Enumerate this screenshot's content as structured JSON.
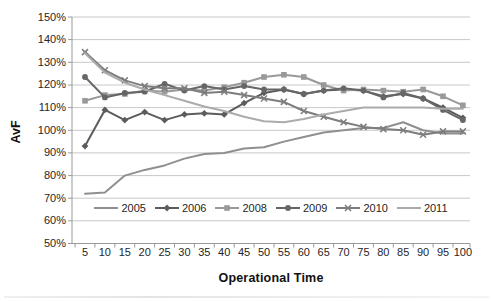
{
  "chart_data": {
    "type": "line",
    "title": "",
    "xlabel": "Operational Time",
    "ylabel": "AvF",
    "x": [
      5,
      10,
      15,
      20,
      25,
      30,
      35,
      40,
      45,
      50,
      55,
      60,
      65,
      70,
      75,
      80,
      85,
      90,
      95,
      100
    ],
    "ylim": [
      50,
      150
    ],
    "y_tick_step": 10,
    "y_tick_suffix": "%",
    "grid": "horizontal",
    "legend_position": "inside-bottom",
    "legend_entries": [
      "2005",
      "2006",
      "2008",
      "2009",
      "2010",
      "2011"
    ],
    "series": [
      {
        "name": "2005",
        "marker": "none",
        "color": "#8f8f8f",
        "values": [
          72,
          72.5,
          80,
          82.5,
          84.5,
          87.5,
          89.5,
          90,
          92,
          92.5,
          95,
          97,
          99,
          100,
          101,
          101,
          103.5,
          100,
          98.5,
          98.5
        ]
      },
      {
        "name": "2006",
        "marker": "diamond",
        "color": "#5c5c5c",
        "values": [
          93,
          109,
          104.5,
          108,
          104.5,
          107,
          107.5,
          107,
          112,
          116.5,
          118,
          116,
          117.5,
          118,
          117.5,
          115,
          116,
          114,
          110,
          105.5
        ]
      },
      {
        "name": "2008",
        "marker": "square",
        "color": "#999999",
        "values": [
          113,
          115.5,
          116,
          117.5,
          117,
          118,
          117.5,
          119,
          121,
          123.5,
          124.5,
          123.5,
          120,
          117.5,
          118,
          117.5,
          117,
          118,
          115,
          111
        ]
      },
      {
        "name": "2009",
        "marker": "circle",
        "color": "#666666",
        "values": [
          123.5,
          114.5,
          116.5,
          117,
          120.5,
          117.5,
          119.5,
          118,
          119.5,
          118,
          118,
          116,
          117.5,
          118.5,
          117.5,
          114.5,
          116.5,
          114,
          109,
          104.5
        ]
      },
      {
        "name": "2010",
        "marker": "x",
        "color": "#7d7d7d",
        "values": [
          134.5,
          126.5,
          122,
          119.5,
          118.5,
          118.5,
          116.5,
          117,
          115.5,
          114,
          112.5,
          108.5,
          106,
          103.5,
          101.5,
          100.5,
          100,
          98,
          99.5,
          99.5
        ]
      },
      {
        "name": "2011",
        "marker": "none",
        "color": "#ababab",
        "values": [
          134,
          125.5,
          121,
          118,
          115.5,
          113,
          110.5,
          108.5,
          106,
          104,
          103.5,
          105,
          107,
          108.5,
          110,
          110,
          110,
          110,
          109.5,
          109.5
        ]
      }
    ]
  }
}
